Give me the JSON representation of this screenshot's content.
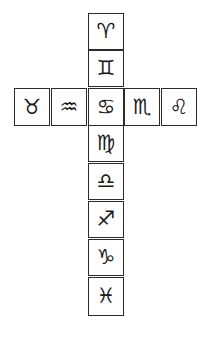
{
  "diagram": {
    "title": "",
    "layout": "cross",
    "vertical_column": [
      {
        "sign": "Aries",
        "symbol": "♈"
      },
      {
        "sign": "Gemini",
        "symbol": "♊"
      },
      {
        "sign": "Cancer",
        "symbol": "♋"
      },
      {
        "sign": "Virgo",
        "symbol": "♍"
      },
      {
        "sign": "Libra",
        "symbol": "♎"
      },
      {
        "sign": "Sagittarius",
        "symbol": "♐"
      },
      {
        "sign": "Capricorn",
        "symbol": "♑"
      },
      {
        "sign": "Pisces",
        "symbol": "♓"
      }
    ],
    "horizontal_row": [
      {
        "sign": "Taurus",
        "symbol": "♉"
      },
      {
        "sign": "Aquarius",
        "symbol": "♒"
      },
      {
        "sign": "Cancer",
        "symbol": "♋"
      },
      {
        "sign": "Scorpio",
        "symbol": "♏"
      },
      {
        "sign": "Leo",
        "symbol": "♌"
      }
    ]
  }
}
